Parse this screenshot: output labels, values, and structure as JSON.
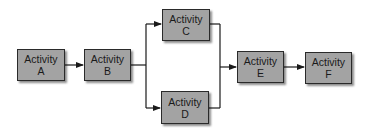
{
  "diagram": {
    "type": "activity-network",
    "nodes": [
      {
        "id": "A",
        "line1": "Activity",
        "line2": "A"
      },
      {
        "id": "B",
        "line1": "Activity",
        "line2": "B"
      },
      {
        "id": "C",
        "line1": "Activity",
        "line2": "C"
      },
      {
        "id": "D",
        "line1": "Activity",
        "line2": "D"
      },
      {
        "id": "E",
        "line1": "Activity",
        "line2": "E"
      },
      {
        "id": "F",
        "line1": "Activity",
        "line2": "F"
      }
    ],
    "edges": [
      {
        "from": "A",
        "to": "B"
      },
      {
        "from": "B",
        "to": "C"
      },
      {
        "from": "B",
        "to": "D"
      },
      {
        "from": "C",
        "to": "E"
      },
      {
        "from": "D",
        "to": "E"
      },
      {
        "from": "E",
        "to": "F"
      }
    ],
    "colors": {
      "node_fill": "#a3a3a3",
      "node_border": "#2a2a2a",
      "line": "#1a1a1a"
    }
  }
}
